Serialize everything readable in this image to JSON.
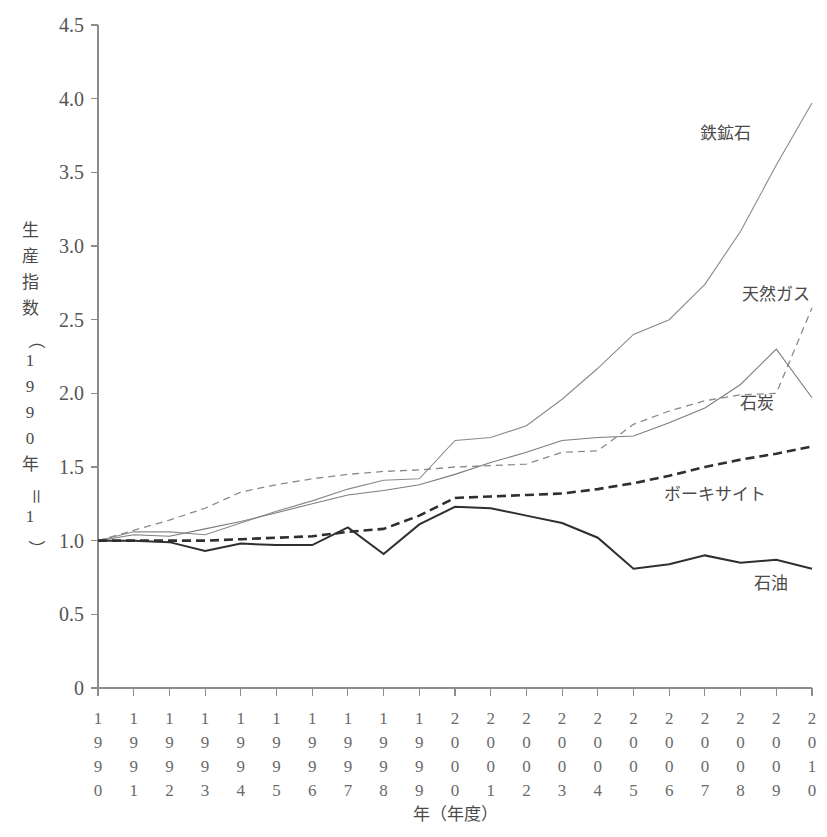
{
  "chart_data": {
    "type": "line",
    "title": "",
    "xlabel": "年（年度）",
    "ylabel": "生産指数（1990年＝1）",
    "ylabel_chars": [
      "生",
      "産",
      "指",
      "数",
      "（",
      "1",
      "9",
      "9",
      "0",
      "年",
      "＝",
      "1",
      "）"
    ],
    "xlim": [
      1990,
      2010
    ],
    "ylim": [
      0,
      4.5
    ],
    "yticks": [
      "0",
      "0.5",
      "1.0",
      "1.5",
      "2.0",
      "2.5",
      "3.0",
      "3.5",
      "4.0",
      "4.5"
    ],
    "ytick_values": [
      0,
      0.5,
      1.0,
      1.5,
      2.0,
      2.5,
      3.0,
      3.5,
      4.0,
      4.5
    ],
    "grid": false,
    "legend_position": "inline-right-of-lines",
    "categories": [
      "1990",
      "1991",
      "1992",
      "1993",
      "1994",
      "1995",
      "1996",
      "1997",
      "1998",
      "1999",
      "2000",
      "2001",
      "2002",
      "2003",
      "2004",
      "2005",
      "2006",
      "2007",
      "2008",
      "2009",
      "2010"
    ],
    "series": [
      {
        "name": "鉄鉱石",
        "label": "鉄鉱石",
        "style": "thin-solid",
        "color": "#8a8a8a",
        "width": 1.1,
        "dash": "",
        "label_x": 700,
        "label_y": 139,
        "values": [
          1.0,
          1.06,
          1.06,
          1.04,
          1.12,
          1.2,
          1.27,
          1.35,
          1.41,
          1.42,
          1.68,
          1.7,
          1.78,
          1.96,
          2.17,
          2.4,
          2.5,
          2.74,
          3.1,
          3.55,
          3.97
        ]
      },
      {
        "name": "天然ガス",
        "label": "天然ガス",
        "style": "thin-dashed",
        "color": "#8a8a8a",
        "width": 1.3,
        "dash": "7,5",
        "label_x": 742,
        "label_y": 300,
        "values": [
          1.0,
          1.07,
          1.14,
          1.22,
          1.33,
          1.38,
          1.42,
          1.45,
          1.47,
          1.48,
          1.5,
          1.51,
          1.52,
          1.6,
          1.61,
          1.79,
          1.88,
          1.95,
          1.99,
          2.0,
          2.58
        ]
      },
      {
        "name": "石炭",
        "label": "石炭",
        "style": "thin-solid",
        "color": "#7d7d7d",
        "width": 1.1,
        "dash": "",
        "label_x": 740,
        "label_y": 409,
        "values": [
          1.0,
          1.04,
          1.03,
          1.08,
          1.13,
          1.19,
          1.25,
          1.31,
          1.34,
          1.38,
          1.45,
          1.53,
          1.6,
          1.68,
          1.7,
          1.71,
          1.8,
          1.9,
          2.06,
          2.3,
          1.97
        ]
      },
      {
        "name": "ボーキサイト",
        "label": "ボーキサイト",
        "style": "thick-dashed",
        "color": "#2f2f2f",
        "width": 2.6,
        "dash": "9,5",
        "label_x": 664,
        "label_y": 500,
        "values": [
          1.0,
          1.0,
          1.0,
          1.0,
          1.01,
          1.02,
          1.03,
          1.06,
          1.08,
          1.17,
          1.29,
          1.3,
          1.31,
          1.32,
          1.35,
          1.39,
          1.44,
          1.5,
          1.55,
          1.59,
          1.64
        ]
      },
      {
        "name": "石油",
        "label": "石油",
        "style": "thick-solid",
        "color": "#2f2f2f",
        "width": 2.0,
        "dash": "",
        "label_x": 754,
        "label_y": 589,
        "values": [
          1.0,
          1.0,
          0.99,
          0.93,
          0.98,
          0.97,
          0.97,
          1.09,
          0.91,
          1.11,
          1.23,
          1.22,
          1.17,
          1.12,
          1.02,
          0.81,
          0.84,
          0.9,
          0.85,
          0.87,
          0.81
        ]
      }
    ]
  }
}
